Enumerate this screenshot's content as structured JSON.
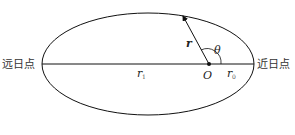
{
  "diagram": {
    "left_label": "远日点",
    "right_label": "近日点",
    "radius_vector_label": "r",
    "angle_label": "θ",
    "focus_label": "O",
    "r1_label": "r",
    "r1_sub": "1",
    "r0_label": "r",
    "r0_sub": "0"
  },
  "colors": {
    "stroke": "#111111",
    "background": "#ffffff"
  }
}
